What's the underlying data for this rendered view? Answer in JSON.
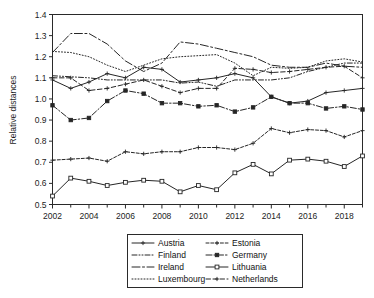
{
  "chart_data": {
    "type": "line",
    "title": "",
    "xlabel": "",
    "ylabel": "Relative distances",
    "ylim": [
      0.5,
      1.4
    ],
    "ytick_values": [
      0.5,
      0.6,
      0.7,
      0.8,
      0.9,
      1.0,
      1.1,
      1.2,
      1.3,
      1.4
    ],
    "ytick_labels": [
      "0.5",
      "0.6",
      "0.7",
      "0.8",
      "0.9",
      "1.0",
      "1.1",
      "1.2",
      "1.3",
      "1.4"
    ],
    "xlim": [
      2002,
      2019
    ],
    "x": [
      2002,
      2003,
      2004,
      2005,
      2006,
      2007,
      2008,
      2009,
      2010,
      2011,
      2012,
      2013,
      2014,
      2015,
      2016,
      2017,
      2018,
      2019
    ],
    "xtick_values": [
      2002,
      2004,
      2006,
      2008,
      2010,
      2012,
      2014,
      2016,
      2018
    ],
    "xtick_labels": [
      "2002",
      "2004",
      "2006",
      "2008",
      "2010",
      "2012",
      "2014",
      "2016",
      "2018"
    ],
    "minor_xticks": [
      2003,
      2005,
      2007,
      2009,
      2011,
      2013,
      2015,
      2017,
      2019
    ],
    "grid": false,
    "legend_position": "below",
    "legend_columns": 2,
    "series": [
      {
        "name": "Austria",
        "marker": "plus",
        "dash": "solid",
        "values": [
          1.09,
          1.05,
          1.08,
          1.12,
          1.1,
          1.15,
          1.14,
          1.08,
          1.09,
          1.1,
          1.12,
          1.1,
          1.01,
          0.98,
          0.99,
          1.03,
          1.04,
          1.05
        ]
      },
      {
        "name": "Estonia",
        "marker": "plus",
        "dash": "dashdot-short",
        "values": [
          0.71,
          0.715,
          0.72,
          0.705,
          0.75,
          0.74,
          0.75,
          0.75,
          0.77,
          0.77,
          0.76,
          0.79,
          0.86,
          0.84,
          0.855,
          0.85,
          0.82,
          0.85
        ]
      },
      {
        "name": "Finland",
        "marker": "none",
        "dash": "dash-dot-dot",
        "values": [
          1.11,
          1.105,
          1.1,
          1.09,
          1.09,
          1.09,
          1.09,
          1.075,
          1.08,
          1.06,
          1.09,
          1.09,
          1.09,
          1.1,
          1.13,
          1.15,
          1.17,
          1.17
        ]
      },
      {
        "name": "Germany",
        "marker": "square-filled",
        "dash": "dashdot",
        "values": [
          0.97,
          0.9,
          0.91,
          0.99,
          1.04,
          1.025,
          0.98,
          0.98,
          0.965,
          0.97,
          0.94,
          0.96,
          1.01,
          0.98,
          0.98,
          0.955,
          0.965,
          0.95
        ]
      },
      {
        "name": "Ireland",
        "marker": "none",
        "dash": "long-dashdot",
        "values": [
          1.22,
          1.31,
          1.31,
          1.26,
          1.18,
          1.13,
          1.17,
          1.27,
          1.26,
          1.24,
          1.22,
          1.2,
          1.16,
          1.15,
          1.15,
          1.17,
          1.155,
          1.15
        ]
      },
      {
        "name": "Lithuania",
        "marker": "square-open",
        "dash": "solid",
        "values": [
          0.54,
          0.625,
          0.61,
          0.59,
          0.605,
          0.615,
          0.61,
          0.56,
          0.59,
          0.57,
          0.65,
          0.69,
          0.645,
          0.71,
          0.715,
          0.705,
          0.68,
          0.73
        ]
      },
      {
        "name": "Luxembourg",
        "marker": "none",
        "dash": "dotted",
        "values": [
          1.225,
          1.22,
          1.2,
          1.16,
          1.13,
          1.16,
          1.19,
          1.2,
          1.205,
          1.21,
          1.17,
          1.11,
          1.15,
          1.145,
          1.15,
          1.18,
          1.19,
          1.175
        ]
      },
      {
        "name": "Netherlands",
        "marker": "plus",
        "dash": "dash-plus",
        "values": [
          1.1,
          1.1,
          1.04,
          1.05,
          1.07,
          1.09,
          1.06,
          1.03,
          1.05,
          1.05,
          1.145,
          1.14,
          1.125,
          1.13,
          1.14,
          1.15,
          1.155,
          1.1
        ]
      }
    ]
  },
  "legend": {
    "entries": [
      {
        "label": "Austria"
      },
      {
        "label": "Estonia"
      },
      {
        "label": "Finland"
      },
      {
        "label": "Germany"
      },
      {
        "label": "Ireland"
      },
      {
        "label": "Lithuania"
      },
      {
        "label": "Luxembourg"
      },
      {
        "label": "Netherlands"
      }
    ]
  }
}
